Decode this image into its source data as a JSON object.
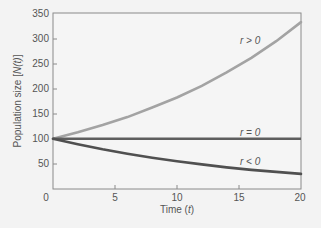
{
  "chart_data": {
    "type": "line",
    "title": "",
    "xlabel": "Time (t)",
    "ylabel": "Population size [N(t)]",
    "xlim": [
      0,
      20
    ],
    "ylim": [
      0,
      350
    ],
    "xticks": [
      0,
      5,
      10,
      15,
      20
    ],
    "yticks": [
      50,
      100,
      150,
      200,
      250,
      300,
      350
    ],
    "grid": false,
    "legend": "inline labels",
    "x": [
      0,
      2,
      4,
      6,
      8,
      10,
      12,
      14,
      16,
      18,
      20
    ],
    "series": [
      {
        "name": "r > 0",
        "color": "#a3a3a3",
        "values": [
          100,
          113,
          127,
          143,
          162,
          182,
          205,
          232,
          261,
          294,
          332
        ]
      },
      {
        "name": "r = 0",
        "color": "#5e5e5e",
        "values": [
          100,
          100,
          100,
          100,
          100,
          100,
          100,
          100,
          100,
          100,
          100
        ]
      },
      {
        "name": "r < 0",
        "color": "#505050",
        "values": [
          100,
          89,
          79,
          70,
          62,
          55,
          49,
          43,
          38,
          34,
          30
        ]
      }
    ]
  },
  "labels": {
    "xlabel_prefix": "Time (",
    "xlabel_var": "t",
    "xlabel_suffix": ")",
    "ylabel_prefix": "Population size [",
    "ylabel_var": "N(t)",
    "ylabel_suffix": "]",
    "x0": "0",
    "x5": "5",
    "x10": "10",
    "x15": "15",
    "x20": "20",
    "y50": "50",
    "y100": "100",
    "y150": "150",
    "y200": "200",
    "y250": "250",
    "y300": "300",
    "y350": "350",
    "curve_pos": "r > 0",
    "curve_zero": "r = 0",
    "curve_neg": "r < 0"
  }
}
